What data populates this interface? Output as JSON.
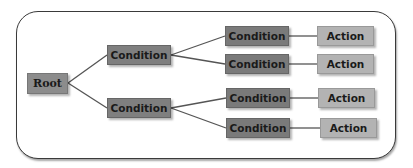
{
  "colors": {
    "root": "#8c8c8c",
    "condition_level1": "#7f7f7f",
    "condition_level2": "#7a7a7a",
    "action": "#b3b3b3",
    "link": "#555555",
    "frame_border": "#3a3a3a"
  },
  "tree": {
    "root": {
      "label": "Root"
    },
    "conditions_level1": [
      {
        "label": "Condition"
      },
      {
        "label": "Condition"
      }
    ],
    "conditions_level2": [
      {
        "label": "Condition"
      },
      {
        "label": "Condition"
      },
      {
        "label": "Condition"
      },
      {
        "label": "Condition"
      }
    ],
    "actions": [
      {
        "label": "Action"
      },
      {
        "label": "Action"
      },
      {
        "label": "Action"
      },
      {
        "label": "Action"
      }
    ]
  }
}
